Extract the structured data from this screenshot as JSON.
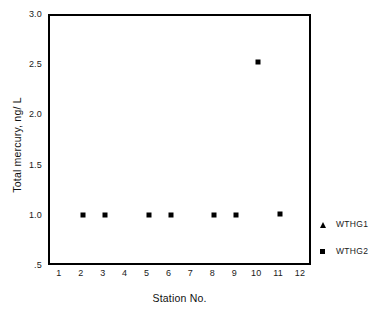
{
  "chart_data": {
    "type": "scatter",
    "title": "",
    "xlabel": "Station No.",
    "ylabel": "Total mercury, ng/ L",
    "xlim": [
      0.5,
      12.5
    ],
    "ylim": [
      0.5,
      3.0
    ],
    "grid": false,
    "legend_position": "right-outside",
    "x_tick_labels": [
      "1",
      "2",
      "3",
      "4",
      "5",
      "6",
      "7",
      "8",
      "9",
      "10",
      "11",
      "12"
    ],
    "x_tick_values": [
      1,
      2,
      3,
      4,
      5,
      6,
      7,
      8,
      9,
      10,
      11,
      12
    ],
    "y_tick_labels": [
      "3.0",
      "2.5",
      "2.0",
      "1.5",
      "1.0",
      ".5"
    ],
    "y_tick_values": [
      3.0,
      2.5,
      2.0,
      1.5,
      1.0,
      0.5
    ],
    "series": [
      {
        "name": "WTHG1",
        "marker": "triangle",
        "color": "#000000",
        "x": [],
        "values": [],
        "points": []
      },
      {
        "name": "WTHG2",
        "marker": "square",
        "color": "#000000",
        "x": [
          2,
          3,
          5,
          6,
          8,
          9,
          10,
          11
        ],
        "values": [
          1.02,
          1.02,
          1.02,
          1.02,
          1.02,
          1.02,
          2.54,
          1.03
        ],
        "points": [
          {
            "x": 2,
            "y": 1.02
          },
          {
            "x": 3,
            "y": 1.02
          },
          {
            "x": 5,
            "y": 1.02
          },
          {
            "x": 6,
            "y": 1.02
          },
          {
            "x": 8,
            "y": 1.02
          },
          {
            "x": 9,
            "y": 1.02
          },
          {
            "x": 10,
            "y": 2.54
          },
          {
            "x": 11,
            "y": 1.03
          }
        ]
      }
    ]
  },
  "legend": {
    "entries": [
      {
        "label": "WTHG1",
        "marker": "triangle"
      },
      {
        "label": "WTHG2",
        "marker": "square"
      }
    ]
  },
  "colors": {
    "marker": "#000000",
    "frame": "#000000",
    "text": "#1a1a1a",
    "background": "#ffffff"
  }
}
